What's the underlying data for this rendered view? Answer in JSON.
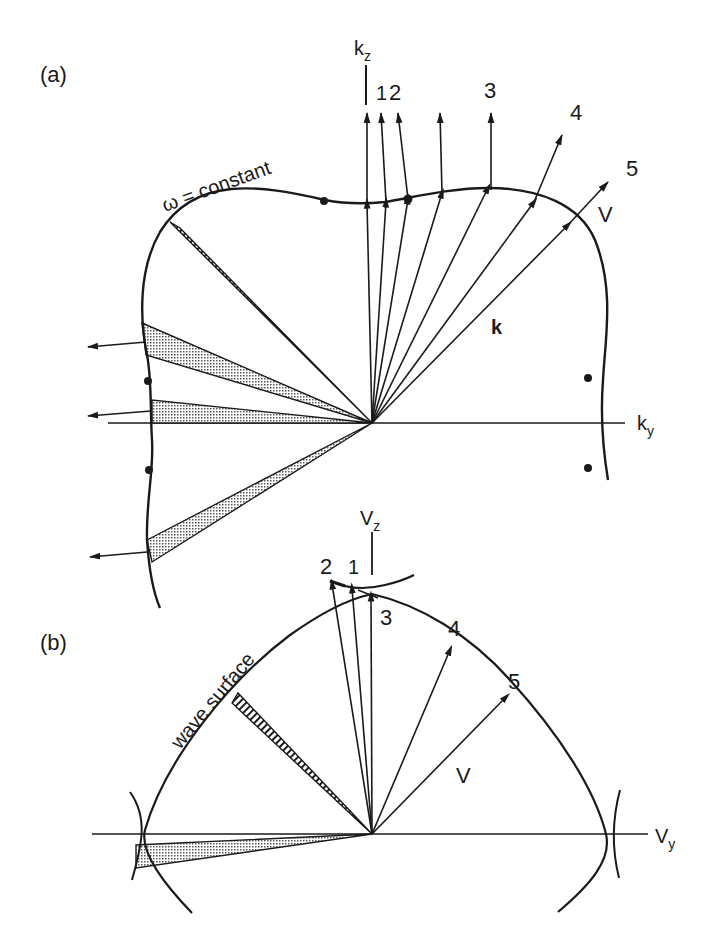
{
  "figure": {
    "panel_a": {
      "label": "(a)",
      "axis_vertical": "k",
      "axis_vertical_sub": "z",
      "axis_horizontal": "k",
      "axis_horizontal_sub": "y",
      "curve_label": "ω = constant",
      "vector_k_label": "k",
      "vector_V_label": "V",
      "point_labels": [
        "1",
        "2",
        "3",
        "4",
        "5"
      ]
    },
    "panel_b": {
      "label": "(b)",
      "axis_vertical": "V",
      "axis_vertical_sub": "z",
      "axis_horizontal": "V",
      "axis_horizontal_sub": "y",
      "curve_label": "wave surface",
      "vector_V_label": "V",
      "point_labels": [
        "1",
        "2",
        "3",
        "4",
        "5"
      ]
    },
    "colors": {
      "ink": "#1a1a1a",
      "background": "#ffffff",
      "stipple": "#9a9a9a"
    }
  }
}
